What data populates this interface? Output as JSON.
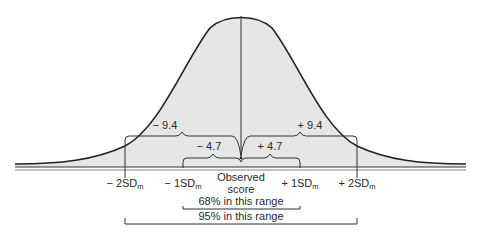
{
  "diagram": {
    "type": "normal-distribution-confidence-interval",
    "center_label": {
      "line1": "Observed",
      "line2": "score"
    },
    "ticks": [
      {
        "id": "minus2sd",
        "prefix": "− 2SD",
        "sub": "m",
        "x": 125
      },
      {
        "id": "minus1sd",
        "prefix": "− 1SD",
        "sub": "m",
        "x": 183
      },
      {
        "id": "plus1sd",
        "prefix": "+ 1SD",
        "sub": "m",
        "x": 300
      },
      {
        "id": "plus2sd",
        "prefix": "+ 2SD",
        "sub": "m",
        "x": 357
      }
    ],
    "braces": {
      "outer_left": "− 9.4",
      "outer_right": "+ 9.4",
      "inner_left": "− 4.7",
      "inner_right": "+ 4.7"
    },
    "ranges": {
      "range68": "68% in this range",
      "range95": "95% in this range"
    },
    "colors": {
      "fill": "#e6e6e6",
      "line": "#222222",
      "text": "#2a2a2a"
    }
  }
}
